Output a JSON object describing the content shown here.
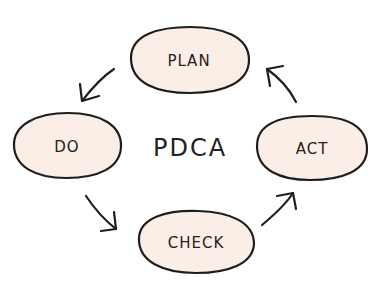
{
  "diagram": {
    "title": "PDCA",
    "colors": {
      "background": "#ffffff",
      "node_fill": "#fbeee6",
      "stroke": "#1e1e1e",
      "text": "#222222"
    },
    "nodes": [
      {
        "id": "plan",
        "label": "PLAN",
        "cx": 189,
        "cy": 60,
        "rx": 60,
        "ry": 32
      },
      {
        "id": "do",
        "label": "DO",
        "cx": 67,
        "cy": 146,
        "rx": 54,
        "ry": 32
      },
      {
        "id": "act",
        "label": "ACT",
        "cx": 312,
        "cy": 148,
        "rx": 55,
        "ry": 32
      },
      {
        "id": "check",
        "label": "CHECK",
        "cx": 196,
        "cy": 242,
        "rx": 58,
        "ry": 31
      }
    ],
    "edges": [
      {
        "from": "plan",
        "to": "do",
        "direction": "down-left"
      },
      {
        "from": "do",
        "to": "check",
        "direction": "down-right"
      },
      {
        "from": "check",
        "to": "act",
        "direction": "up-right"
      },
      {
        "from": "act",
        "to": "plan",
        "direction": "up-left"
      }
    ]
  }
}
